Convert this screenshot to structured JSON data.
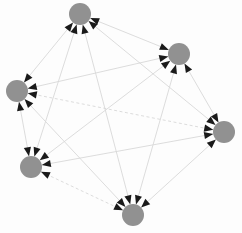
{
  "figure": {
    "title": "",
    "type": "directed-graph",
    "width": 242,
    "height": 233,
    "background_color": "#fdfdfd"
  },
  "style": {
    "node_fill": "#919191",
    "node_radius": 11,
    "edge_color": "#d8d8d8",
    "edge_width": 0.9,
    "arrow_color": "#1a1a1a",
    "arrow_length": 9,
    "arrow_half_width": 3.6,
    "dash_pattern": "3,2.5"
  },
  "graph": {
    "node_count": 6,
    "edge_count": 15,
    "directed": true,
    "bidirectional": true,
    "nodes": [
      {
        "id": "n0",
        "label": "",
        "x": 80,
        "y": 14,
        "r": 11
      },
      {
        "id": "n1",
        "label": "",
        "x": 179,
        "y": 54,
        "r": 11
      },
      {
        "id": "n2",
        "label": "",
        "x": 17,
        "y": 91,
        "r": 11
      },
      {
        "id": "n3",
        "label": "",
        "x": 224,
        "y": 132,
        "r": 11
      },
      {
        "id": "n4",
        "label": "",
        "x": 31,
        "y": 167,
        "r": 11
      },
      {
        "id": "n5",
        "label": "",
        "x": 133,
        "y": 215,
        "r": 11
      }
    ],
    "edges": [
      {
        "id": "e0",
        "source": "n0",
        "target": "n1",
        "style": "solid",
        "arrow_source": true,
        "arrow_target": true
      },
      {
        "id": "e1",
        "source": "n0",
        "target": "n2",
        "style": "solid",
        "arrow_source": true,
        "arrow_target": true
      },
      {
        "id": "e2",
        "source": "n0",
        "target": "n3",
        "style": "solid",
        "arrow_source": true,
        "arrow_target": true
      },
      {
        "id": "e3",
        "source": "n0",
        "target": "n4",
        "style": "solid",
        "arrow_source": true,
        "arrow_target": true
      },
      {
        "id": "e4",
        "source": "n0",
        "target": "n5",
        "style": "solid",
        "arrow_source": true,
        "arrow_target": true
      },
      {
        "id": "e5",
        "source": "n1",
        "target": "n2",
        "style": "solid",
        "arrow_source": true,
        "arrow_target": true
      },
      {
        "id": "e6",
        "source": "n1",
        "target": "n3",
        "style": "solid",
        "arrow_source": true,
        "arrow_target": true
      },
      {
        "id": "e7",
        "source": "n1",
        "target": "n4",
        "style": "solid",
        "arrow_source": true,
        "arrow_target": true
      },
      {
        "id": "e8",
        "source": "n1",
        "target": "n5",
        "style": "solid",
        "arrow_source": true,
        "arrow_target": true
      },
      {
        "id": "e9",
        "source": "n2",
        "target": "n3",
        "style": "dashed",
        "arrow_source": true,
        "arrow_target": true
      },
      {
        "id": "e10",
        "source": "n2",
        "target": "n4",
        "style": "solid",
        "arrow_source": true,
        "arrow_target": true
      },
      {
        "id": "e11",
        "source": "n2",
        "target": "n5",
        "style": "solid",
        "arrow_source": true,
        "arrow_target": true
      },
      {
        "id": "e12",
        "source": "n3",
        "target": "n4",
        "style": "solid",
        "arrow_source": true,
        "arrow_target": true
      },
      {
        "id": "e13",
        "source": "n3",
        "target": "n5",
        "style": "solid",
        "arrow_source": true,
        "arrow_target": true
      },
      {
        "id": "e14",
        "source": "n4",
        "target": "n5",
        "style": "dashed",
        "arrow_source": true,
        "arrow_target": true
      }
    ]
  }
}
